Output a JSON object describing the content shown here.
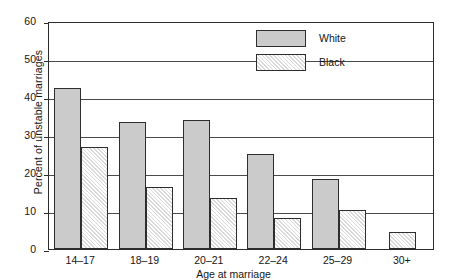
{
  "chart_data": {
    "type": "bar",
    "title": "",
    "subtitle": "",
    "xlabel": "Age at marriage",
    "ylabel": "Percent of unstable marriages",
    "categories": [
      "14–17",
      "18–19",
      "20–21",
      "22–24",
      "25–29",
      "30+"
    ],
    "series": [
      {
        "name": "White",
        "values": [
          42.5,
          33.5,
          34.0,
          25.0,
          18.3,
          null
        ]
      },
      {
        "name": "Black",
        "values": [
          26.8,
          16.3,
          13.5,
          8.1,
          10.2,
          4.4
        ]
      }
    ],
    "ylim": [
      0,
      60
    ],
    "ytick_labels": [
      "0",
      "10",
      "20",
      "30",
      "40",
      "50",
      "60"
    ],
    "ytick_values": [
      0,
      10,
      20,
      30,
      40,
      50,
      60
    ],
    "grid": "horizontal",
    "legend_position": "top-right",
    "colors": {
      "white_series_fill": "#cbcbcb",
      "black_series_fill": "#d9d9d9",
      "bar_outline": "#2e2e2e",
      "grid": "#4a4a4a",
      "axis": "#2b2b2b",
      "text": "#161616",
      "background": "#ffffff"
    }
  },
  "legend": {
    "items": [
      {
        "label": "White",
        "swatch": "solid-gray-swatch"
      },
      {
        "label": "Black",
        "swatch": "hatched-swatch"
      }
    ]
  }
}
